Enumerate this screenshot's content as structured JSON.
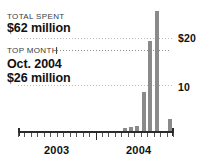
{
  "annotations": {
    "total_caption": "TOTAL SPENT",
    "total_value": "$62 million",
    "top_caption": "TOP MONTH",
    "top_month": "Oct. 2004",
    "top_amount": "$26 million"
  },
  "colors": {
    "bar": "#8a8a8a",
    "axis": "#2b2b2b",
    "grid": "#bdbdbd",
    "text": "#111111",
    "caption": "#3b3b3b",
    "background": "#ffffff"
  },
  "chart_data": {
    "type": "bar",
    "title": "",
    "xlabel": "",
    "ylabel": "",
    "ylim": [
      0,
      27
    ],
    "grid": true,
    "legend_position": "none",
    "yticks": [
      10,
      20
    ],
    "ytick_labels": [
      "10",
      "$20"
    ],
    "xtick_labels": [
      "2003",
      "2004"
    ],
    "categories": [
      "Jan 2003",
      "Feb 2003",
      "Mar 2003",
      "Apr 2003",
      "May 2003",
      "Jun 2003",
      "Jul 2003",
      "Aug 2003",
      "Sep 2003",
      "Oct 2003",
      "Nov 2003",
      "Dec 2003",
      "Jan 2004",
      "Feb 2004",
      "Mar 2004",
      "Apr 2004",
      "May 2004",
      "Jun 2004",
      "Jul 2004",
      "Aug 2004",
      "Sep 2004",
      "Oct 2004",
      "Nov 2004",
      "Dec 2004"
    ],
    "values": [
      0,
      0,
      0,
      0,
      0,
      0,
      0,
      0,
      0,
      0,
      0,
      0,
      0,
      0,
      0,
      0,
      0.7,
      0.8,
      1.0,
      8.5,
      19.5,
      26.0,
      0,
      2.6
    ],
    "annotations": [
      {
        "label": "TOTAL SPENT",
        "value": "$62 million"
      },
      {
        "label": "TOP MONTH",
        "value": "Oct. 2004 $26 million",
        "points_to": "Oct 2004"
      }
    ]
  }
}
